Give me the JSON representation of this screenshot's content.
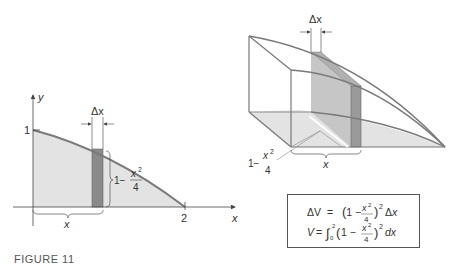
{
  "figure": {
    "caption": "FIGURE 11",
    "colors": {
      "region_fill": "#e3e3e3",
      "strip_fill": "#8a8a8a",
      "curve": "#7a7a7a",
      "axis": "#444444",
      "text": "#333333"
    }
  },
  "left_plot": {
    "y_axis_label": "y",
    "x_axis_label": "x",
    "y_tick_label": "1",
    "x_tick_label": "2",
    "strip_width_label": "Δx",
    "strip_height_label_prefix": "1−",
    "strip_height_label_num": "x",
    "strip_height_label_exp": "2",
    "strip_height_label_den": "4",
    "brace_label": "x",
    "curve": "y = 1 − x²/4, 0 ≤ x ≤ 2"
  },
  "right_solid": {
    "strip_width_label": "Δx",
    "side_label_prefix": "1−",
    "side_label_num": "x",
    "side_label_exp": "2",
    "side_label_den": "4",
    "brace_label": "x"
  },
  "formulas": {
    "line1": {
      "lhs": "ΔV",
      "eq": "=",
      "body": "(1 − x²/4)² Δx"
    },
    "line2": {
      "lhs": "V",
      "eq": "=",
      "integral": "∫",
      "lower": "0",
      "upper": "2",
      "body": "(1 − x²/4)² dx"
    }
  }
}
